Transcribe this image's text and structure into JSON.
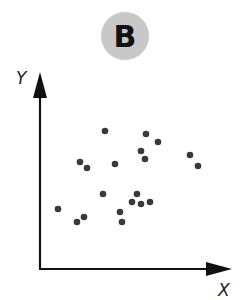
{
  "panel": {
    "label": "B",
    "badge_color": "#c8c8c8"
  },
  "chart_data": {
    "type": "scatter",
    "title": "B",
    "xlabel": "X",
    "ylabel": "Y",
    "grid": false,
    "ticks": false,
    "marker_color": "#3a3a3a",
    "note": "Pixel-space coordinates converted to relative axis units (origin at axis corner, 0-100 scale).",
    "points": [
      {
        "x": 21.1,
        "y": 55.8
      },
      {
        "x": 24.7,
        "y": 52.8
      },
      {
        "x": 9.5,
        "y": 31.0
      },
      {
        "x": 19.5,
        "y": 24.4
      },
      {
        "x": 23.2,
        "y": 26.9
      },
      {
        "x": 34.2,
        "y": 69.5
      },
      {
        "x": 55.8,
        "y": 68.0
      },
      {
        "x": 62.1,
        "y": 64.0
      },
      {
        "x": 53.2,
        "y": 59.4
      },
      {
        "x": 55.3,
        "y": 55.3
      },
      {
        "x": 39.5,
        "y": 53.8
      },
      {
        "x": 33.2,
        "y": 38.1
      },
      {
        "x": 51.1,
        "y": 38.1
      },
      {
        "x": 48.4,
        "y": 34.0
      },
      {
        "x": 53.2,
        "y": 33.0
      },
      {
        "x": 57.9,
        "y": 34.0
      },
      {
        "x": 42.1,
        "y": 29.4
      },
      {
        "x": 43.2,
        "y": 24.4
      },
      {
        "x": 78.9,
        "y": 57.4
      },
      {
        "x": 83.2,
        "y": 51.8
      }
    ],
    "pixel_points": [
      [
        80,
        162
      ],
      [
        87,
        168
      ],
      [
        58,
        209
      ],
      [
        77,
        222
      ],
      [
        84,
        217
      ],
      [
        105,
        131
      ],
      [
        146,
        134
      ],
      [
        158,
        142
      ],
      [
        141,
        151
      ],
      [
        145,
        159
      ],
      [
        115,
        164
      ],
      [
        103,
        194
      ],
      [
        137,
        194
      ],
      [
        132,
        202
      ],
      [
        141,
        204
      ],
      [
        150,
        202
      ],
      [
        120,
        212
      ],
      [
        122,
        222
      ],
      [
        190,
        155
      ],
      [
        198,
        166
      ]
    ],
    "axes": {
      "origin_px": [
        40,
        269
      ],
      "y_tip_px": [
        40,
        72
      ],
      "x_tip_px": [
        232,
        269
      ]
    }
  }
}
